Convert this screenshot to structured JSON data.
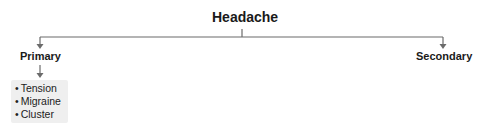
{
  "diagram": {
    "type": "tree",
    "root": {
      "label": "Headache"
    },
    "children": [
      {
        "label": "Primary",
        "items": [
          "Tension",
          "Migraine",
          "Cluster"
        ]
      },
      {
        "label": "Secondary",
        "items": []
      }
    ],
    "colors": {
      "line": "#6b6b6b",
      "text": "#1a1a1a",
      "list_background": "#efefef"
    }
  }
}
